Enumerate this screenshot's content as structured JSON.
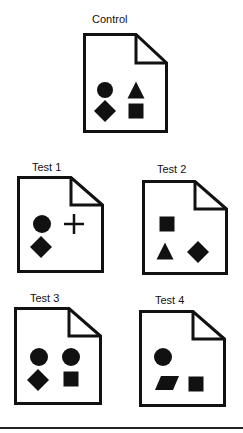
{
  "diagram": {
    "documents": [
      {
        "id": "control",
        "label": "Control",
        "label_pos": [
          92,
          13
        ],
        "box": [
          83,
          33,
          85,
          100
        ],
        "shapes": [
          {
            "type": "circle",
            "cx": 22,
            "cy": 57,
            "r": 8
          },
          {
            "type": "triangle",
            "cx": 53,
            "cy": 57,
            "size": 17
          },
          {
            "type": "diamond",
            "cx": 22,
            "cy": 78,
            "size": 11
          },
          {
            "type": "square",
            "cx": 53,
            "cy": 78,
            "size": 15
          }
        ]
      },
      {
        "id": "test-1",
        "label": "Test 1",
        "label_pos": [
          32,
          161
        ],
        "box": [
          17,
          176,
          87,
          97
        ],
        "shapes": [
          {
            "type": "circle",
            "cx": 25,
            "cy": 48,
            "r": 9
          },
          {
            "type": "plus",
            "cx": 57,
            "cy": 48,
            "size": 20
          },
          {
            "type": "diamond",
            "cx": 24,
            "cy": 71,
            "size": 11
          }
        ]
      },
      {
        "id": "test-2",
        "label": "Test 2",
        "label_pos": [
          157,
          163
        ],
        "box": [
          142,
          180,
          86,
          95
        ],
        "shapes": [
          {
            "type": "square",
            "cx": 25,
            "cy": 44,
            "size": 15
          },
          {
            "type": "triangle",
            "cx": 23,
            "cy": 71,
            "size": 17
          },
          {
            "type": "diamond",
            "cx": 56,
            "cy": 72,
            "size": 11
          }
        ]
      },
      {
        "id": "test-3",
        "label": "Test 3",
        "label_pos": [
          30,
          292
        ],
        "box": [
          14,
          307,
          88,
          98
        ],
        "shapes": [
          {
            "type": "circle",
            "cx": 25,
            "cy": 50,
            "r": 9
          },
          {
            "type": "circle",
            "cx": 57,
            "cy": 50,
            "r": 9
          },
          {
            "type": "diamond",
            "cx": 24,
            "cy": 73,
            "size": 11
          },
          {
            "type": "square",
            "cx": 57,
            "cy": 72,
            "size": 15
          }
        ]
      },
      {
        "id": "test-4",
        "label": "Test 4",
        "label_pos": [
          155,
          294
        ],
        "box": [
          139,
          310,
          87,
          97
        ],
        "shapes": [
          {
            "type": "circle",
            "cx": 24,
            "cy": 47,
            "r": 9
          },
          {
            "type": "parallelogram",
            "cx": 28,
            "cy": 73,
            "w": 24,
            "h": 14
          },
          {
            "type": "square",
            "cx": 57,
            "cy": 74,
            "size": 15
          }
        ]
      }
    ],
    "colors": {
      "stroke": "#111111",
      "fill": "#111111",
      "paper": "#ffffff",
      "rule": "#222222"
    }
  }
}
